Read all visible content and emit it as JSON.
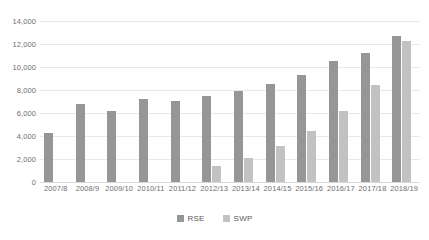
{
  "chart_data": {
    "type": "bar",
    "title": "",
    "subtitle": "",
    "xlabel": "",
    "ylabel": "",
    "ylim": [
      0,
      14000
    ],
    "ytick_step": 2000,
    "ytick_labels": [
      "14,000",
      "12,000",
      "10,000",
      "8,000",
      "6,000",
      "4,000",
      "2,000",
      "0"
    ],
    "ytick_values": [
      14000,
      12000,
      10000,
      8000,
      6000,
      4000,
      2000,
      0
    ],
    "grid": true,
    "legend_position": "bottom",
    "categories": [
      "2007/8",
      "2008/9",
      "2009/10",
      "2010/11",
      "2011/12",
      "2012/13",
      "2013/14",
      "2014/15",
      "2015/16",
      "2016/17",
      "2017/18",
      "2018/19"
    ],
    "series": [
      {
        "name": "RSE",
        "color": "#969696",
        "values": [
          4300,
          6800,
          6150,
          7200,
          7050,
          7500,
          7900,
          8500,
          9300,
          10500,
          11200,
          12700
        ]
      },
      {
        "name": "SWP",
        "color": "#c2c2c2",
        "values": [
          0,
          0,
          0,
          0,
          0,
          1400,
          2100,
          3100,
          4400,
          6200,
          8400,
          12300
        ]
      }
    ]
  },
  "legend": {
    "items": [
      {
        "label": "RSE",
        "color": "#969696"
      },
      {
        "label": "SWP",
        "color": "#c2c2c2"
      }
    ]
  },
  "colors": {
    "gridline": "#e8e8e8",
    "axis_text": "#6e6e6e",
    "background": "#ffffff"
  }
}
